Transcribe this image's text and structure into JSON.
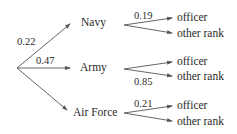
{
  "tree": {
    "root": "",
    "branches": [
      {
        "label": "Navy",
        "probability": "0.22",
        "children": [
          {
            "label": "officer",
            "probability": "0.19"
          },
          {
            "label": "other rank",
            "probability": ""
          }
        ]
      },
      {
        "label": "Army",
        "probability": "0.47",
        "children": [
          {
            "label": "officer",
            "probability": ""
          },
          {
            "label": "other rank",
            "probability": "0.85"
          }
        ]
      },
      {
        "label": "Air Force",
        "probability": "",
        "children": [
          {
            "label": "officer",
            "probability": "0.21"
          },
          {
            "label": "other rank",
            "probability": ""
          }
        ]
      }
    ]
  },
  "colors": {
    "line": "#555555",
    "text": "#2a2a2a",
    "background": "#ffffff"
  }
}
